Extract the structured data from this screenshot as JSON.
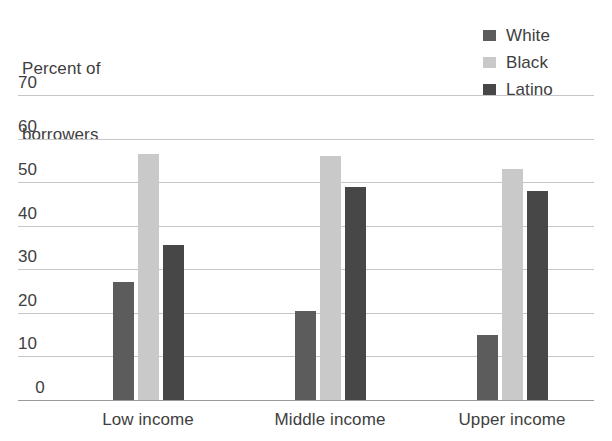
{
  "chart_data": {
    "type": "bar",
    "title": "Percent of borrowers",
    "title_lines": [
      "Percent of",
      "borrowers"
    ],
    "xlabel": "",
    "ylabel": "Percent of borrowers",
    "categories": [
      "Low income",
      "Middle income",
      "Upper income"
    ],
    "series": [
      {
        "name": "White",
        "color": "#5c5c5c",
        "values": [
          27,
          20.5,
          15
        ]
      },
      {
        "name": "Black",
        "color": "#c9c9c9",
        "values": [
          56.5,
          56,
          53
        ]
      },
      {
        "name": "Latino",
        "color": "#474747",
        "values": [
          35.5,
          49,
          48
        ]
      }
    ],
    "ylim": [
      0,
      70
    ],
    "yticks": [
      70,
      60,
      50,
      40,
      30,
      20,
      10,
      0
    ],
    "ytick_labels": [
      "70",
      "60",
      "50",
      "40",
      "30",
      "20",
      "10",
      "0"
    ],
    "grid": true,
    "legend_position": "top-right"
  },
  "legend": {
    "entries": [
      {
        "label": "White",
        "swatch": "white-swatch"
      },
      {
        "label": "Black",
        "swatch": "black-swatch"
      },
      {
        "label": "Latino",
        "swatch": "latino-swatch"
      }
    ]
  },
  "colors": {
    "white_series": "#5c5c5c",
    "black_series": "#c9c9c9",
    "latino_series": "#474747",
    "gridline": "#c6c6c6",
    "axis": "#9a9a9a",
    "text": "#3e3e3e",
    "background": "#ffffff"
  }
}
